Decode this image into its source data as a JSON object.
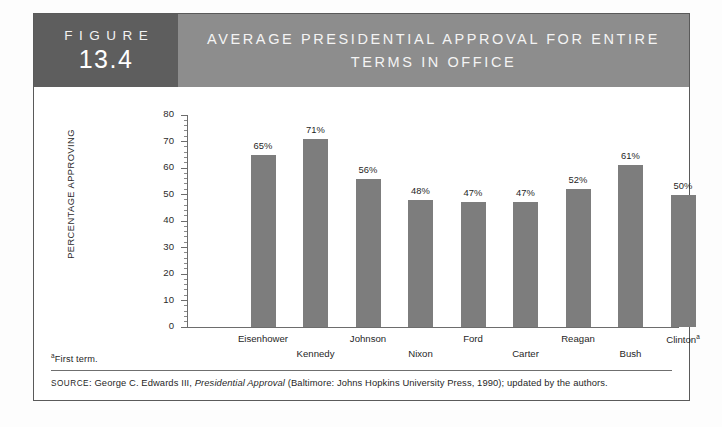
{
  "figure": {
    "label_word": "FIGURE",
    "number": "13.4",
    "title_line1": "AVERAGE PRESIDENTIAL APPROVAL FOR ENTIRE",
    "title_line2": "TERMS IN OFFICE"
  },
  "notes": {
    "footnote_marker": "a",
    "footnote_text": "First term.",
    "source_prefix": "SOURCE",
    "source_rest_1": ": George C. Edwards III, ",
    "source_italic": "Presidential Approval",
    "source_rest_2": " (Baltimore: Johns Hopkins University Press, 1990); updated by the authors."
  },
  "colors": {
    "figure_block": "#5e5e5e",
    "header_band": "#8d8d8d",
    "bar_fill": "#7d7d7d",
    "axis": "#6d6d6d",
    "panel_border": "#5a5a5a"
  },
  "chart_data": {
    "type": "bar",
    "title": "AVERAGE PRESIDENTIAL APPROVAL FOR ENTIRE TERMS IN OFFICE",
    "xlabel": "",
    "ylabel": "PERCENTAGE APPROVING",
    "ylim": [
      0,
      80
    ],
    "ytick_step": 10,
    "yticks": [
      0,
      10,
      20,
      30,
      40,
      50,
      60,
      70,
      80
    ],
    "ytick_labels": [
      "0",
      "10",
      "20",
      "30",
      "40",
      "50",
      "60",
      "70",
      "80"
    ],
    "minor_ticks": true,
    "grid": false,
    "legend": "none",
    "categories": [
      "Eisenhower",
      "Kennedy",
      "Johnson",
      "Nixon",
      "Ford",
      "Carter",
      "Reagan",
      "Bush",
      "Clinton"
    ],
    "category_markers": [
      "",
      "",
      "",
      "",
      "",
      "",
      "",
      "",
      "a"
    ],
    "values": [
      65,
      71,
      56,
      48,
      47,
      47,
      52,
      61,
      50
    ],
    "value_labels": [
      "65%",
      "71%",
      "56%",
      "48%",
      "47%",
      "47%",
      "52%",
      "61%",
      "50%"
    ]
  }
}
